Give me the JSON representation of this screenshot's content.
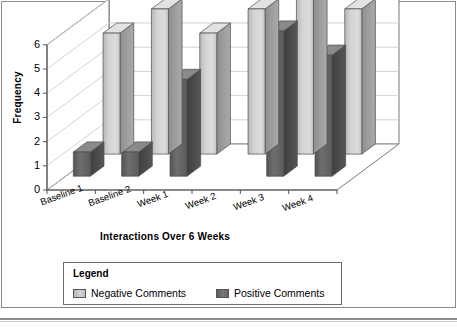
{
  "chart_data": {
    "type": "bar",
    "title": "",
    "subtitle": "",
    "xlabel": "Interactions Over 6 Weeks",
    "ylabel": "Frequency",
    "categories": [
      "Baseline 1",
      "Baseline 2",
      "Week 1",
      "Week 2",
      "Week 3",
      "Week 4"
    ],
    "series": [
      {
        "name": "Negative Comments",
        "values": [
          5,
          6,
          5,
          6,
          7,
          6
        ],
        "color": "#cccccc"
      },
      {
        "name": "Positive Comments",
        "values": [
          1,
          1,
          4,
          0,
          6,
          5
        ],
        "color": "#636363"
      }
    ],
    "ylim": [
      0,
      6
    ],
    "yticks": [
      0,
      1,
      2,
      3,
      4,
      5,
      6
    ],
    "ytick_labels": [
      "0",
      "1",
      "2",
      "3",
      "4",
      "5",
      "6"
    ],
    "grid": true,
    "grid_axis": "y",
    "legend_position": "below-plot",
    "projection": "3d",
    "bar_style": "3d-vertical-columns"
  },
  "legend": {
    "title": "Legend",
    "items": [
      {
        "label": "Negative Comments",
        "swatch": "negative-swatch"
      },
      {
        "label": "Positive Comments",
        "swatch": "positive-swatch"
      }
    ]
  },
  "axes": {
    "y_title": "Frequency",
    "x_title": "Interactions Over 6 Weeks",
    "y_ticks": [
      "6",
      "5",
      "4",
      "3",
      "2",
      "1",
      "0"
    ],
    "x_ticks": [
      "Baseline 1",
      "Baseline 2",
      "Week 1",
      "Week 2",
      "Week 3",
      "Week 4"
    ]
  },
  "colors": {
    "negative_light": "#d6d6d6",
    "negative_mid": "#c2c2c2",
    "negative_dark": "#9a9a9a",
    "positive_light": "#7a7a7a",
    "positive_mid": "#666666",
    "positive_dark": "#4a4a4a",
    "grid": "#c8c8c8",
    "axis": "#555555",
    "frame": "#8a8a8a",
    "wall": "#ffffff"
  }
}
